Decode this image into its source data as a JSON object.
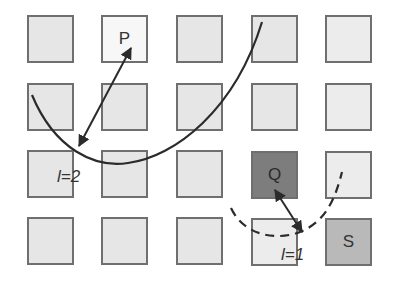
{
  "diagram": {
    "grid": {
      "columns": 5,
      "rows": 4
    },
    "nodes": {
      "P": {
        "label": "P",
        "row": 1,
        "col": 2,
        "fill": "#f7f7f7"
      },
      "Q": {
        "label": "Q",
        "row": 3,
        "col": 4,
        "fill": "#7d7d7d"
      },
      "S": {
        "label": "S",
        "row": 4,
        "col": 5,
        "fill": "#b9b9b9"
      }
    },
    "annotations": {
      "l2": "l=2",
      "l1": "l=1"
    },
    "colors": {
      "cell_fill": "#e6e6e6",
      "cell_border": "#6f6f6f",
      "q_fill": "#7d7d7d",
      "s_fill": "#b9b9b9",
      "line": "#2b2b2b"
    }
  }
}
